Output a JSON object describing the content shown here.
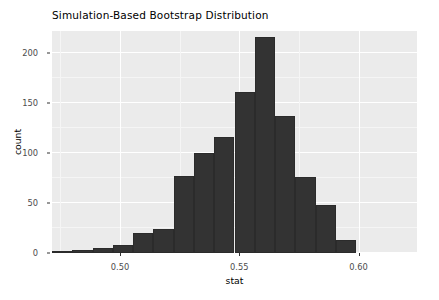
{
  "chart_data": {
    "type": "bar",
    "title": "Simulation-Based Bootstrap Distribution",
    "xlabel": "stat",
    "ylabel": "count",
    "grid": true,
    "legend": "none",
    "xlim": [
      0.4715,
      0.6245
    ],
    "ylim": [
      0,
      222
    ],
    "x_ticks": [
      0.5,
      0.55,
      0.6
    ],
    "x_tick_labels": [
      "0.50",
      "0.55",
      "0.60"
    ],
    "y_ticks": [
      0,
      50,
      100,
      150,
      200
    ],
    "y_tick_labels": [
      "0",
      "50",
      "100",
      "150",
      "200"
    ],
    "bin_width": 0.0085,
    "bin_centers": [
      0.4757,
      0.4842,
      0.4927,
      0.5012,
      0.5097,
      0.5182,
      0.5267,
      0.5352,
      0.5437,
      0.5522,
      0.5607,
      0.5692,
      0.5777,
      0.5862,
      0.5947,
      0.6032,
      0.6117,
      0.6202
    ],
    "categories": [
      "0.476",
      "0.484",
      "0.493",
      "0.501",
      "0.510",
      "0.518",
      "0.527",
      "0.535",
      "0.544",
      "0.552",
      "0.561",
      "0.569",
      "0.578",
      "0.586",
      "0.595",
      "0.603",
      "0.612",
      "0.620"
    ],
    "values": [
      2,
      3,
      5,
      8,
      20,
      24,
      77,
      100,
      116,
      161,
      216,
      137,
      76,
      48,
      13,
      0,
      0,
      0
    ],
    "bars": [
      {
        "x0": 0.4715,
        "x1": 0.48,
        "count": 2
      },
      {
        "x0": 0.48,
        "x1": 0.4885,
        "count": 3
      },
      {
        "x0": 0.4885,
        "x1": 0.497,
        "count": 5
      },
      {
        "x0": 0.497,
        "x1": 0.5055,
        "count": 8
      },
      {
        "x0": 0.5055,
        "x1": 0.514,
        "count": 20
      },
      {
        "x0": 0.514,
        "x1": 0.5225,
        "count": 24
      },
      {
        "x0": 0.5225,
        "x1": 0.531,
        "count": 77
      },
      {
        "x0": 0.531,
        "x1": 0.5395,
        "count": 100
      },
      {
        "x0": 0.5395,
        "x1": 0.548,
        "count": 116
      },
      {
        "x0": 0.548,
        "x1": 0.5565,
        "count": 161
      },
      {
        "x0": 0.5565,
        "x1": 0.565,
        "count": 216
      },
      {
        "x0": 0.565,
        "x1": 0.5735,
        "count": 137
      },
      {
        "x0": 0.5735,
        "x1": 0.582,
        "count": 76
      },
      {
        "x0": 0.582,
        "x1": 0.5905,
        "count": 48
      },
      {
        "x0": 0.5905,
        "x1": 0.599,
        "count": 13
      }
    ],
    "bar_color": "#333333",
    "panel_color": "#ebebeb",
    "grid_color": "#ffffff"
  }
}
